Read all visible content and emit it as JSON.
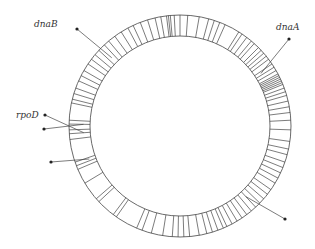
{
  "diagram": {
    "center": [
      180,
      126
    ],
    "outer_radius": 111,
    "inner_radius": 90,
    "colors": {
      "stroke": "#444444",
      "text": "#333333",
      "background": "#ffffff"
    },
    "gene_tick_angles_deg": [
      -168,
      -166,
      -163,
      -160,
      -156,
      -153,
      -150,
      -146,
      -143,
      -140,
      -137,
      -133,
      -130,
      -126,
      -122,
      -118,
      -115,
      -111,
      -107,
      -103,
      -100,
      -97,
      -96,
      -95,
      -93,
      -90,
      -86,
      -80,
      -75,
      -72,
      -69,
      -66,
      -58,
      -56,
      -53,
      -50,
      -48,
      -45,
      -43,
      -41,
      -39,
      -37,
      -34,
      -32,
      -30,
      -28,
      -27,
      -26,
      -25,
      -24,
      -23,
      -22,
      -20,
      -18,
      -16,
      -13,
      -10,
      -7,
      -3,
      2,
      8,
      12,
      15,
      19,
      22,
      25,
      28,
      31,
      35,
      38,
      41,
      44,
      47,
      50,
      53,
      56,
      59,
      62,
      65,
      67,
      70,
      73,
      76,
      80,
      85,
      88,
      91,
      94,
      99,
      105,
      110,
      113,
      125,
      127,
      137,
      139,
      149,
      157,
      159,
      161,
      173,
      176,
      178,
      181,
      183
    ],
    "markers": [
      {
        "id": "dnaB",
        "label": "dnaB",
        "dot": [
          77,
          29
        ],
        "target_angle_deg": -135,
        "label_pos": [
          34,
          27
        ]
      },
      {
        "id": "dnaA",
        "label": "dnaA",
        "dot": [
          289,
          39
        ],
        "target_angle_deg": -33,
        "label_pos": [
          276,
          30
        ]
      },
      {
        "id": "rpoD",
        "label": "rpoD",
        "dot": [
          45,
          115
        ],
        "target_angle_deg": 176,
        "label_pos": [
          16,
          118
        ]
      },
      {
        "id": "unlabeled-1",
        "label": "",
        "dot": [
          44,
          129
        ],
        "target_angle_deg": 181,
        "label_pos": null
      },
      {
        "id": "unlabeled-2",
        "label": "",
        "dot": [
          51,
          162
        ],
        "target_angle_deg": 160,
        "label_pos": null
      },
      {
        "id": "unlabeled-3",
        "label": "",
        "dot": [
          285,
          219
        ],
        "target_angle_deg": 47,
        "label_pos": null
      }
    ]
  }
}
